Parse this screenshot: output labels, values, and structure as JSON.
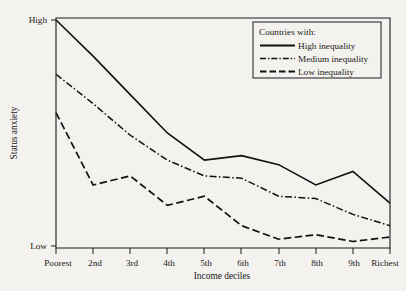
{
  "chart_data": {
    "type": "line",
    "title": "",
    "xlabel": "Income deciles",
    "ylabel": "Status anxiety",
    "categories": [
      "Poorest",
      "2nd",
      "3rd",
      "4th",
      "5th",
      "6th",
      "7th",
      "8th",
      "9th",
      "Richest"
    ],
    "ytick_labels": [
      "High",
      "Low"
    ],
    "ylim_labels": {
      "top": "High",
      "bottom": "Low"
    },
    "grid": false,
    "legend_position": "top-right",
    "legend_title": "Countries with:",
    "series": [
      {
        "name": "High inequality",
        "style": "solid",
        "values": [
          100,
          84,
          67,
          50,
          38,
          40,
          36,
          27,
          33,
          19
        ]
      },
      {
        "name": "Medium inequality",
        "style": "dash-dot",
        "values": [
          76,
          63,
          49,
          38,
          31,
          30,
          22,
          21,
          14,
          9
        ]
      },
      {
        "name": "Low inequality",
        "style": "dashed",
        "values": [
          59,
          27,
          31,
          18,
          22,
          9,
          3,
          5,
          2,
          4
        ]
      }
    ]
  },
  "legend": {
    "title": "Countries with:",
    "entries": [
      {
        "label": "High inequality",
        "style": "solid"
      },
      {
        "label": "Medium inequality",
        "style": "dash-dot"
      },
      {
        "label": "Low inequality",
        "style": "dashed"
      }
    ]
  },
  "axes": {
    "y_title": "Status anxiety",
    "x_title": "Income deciles",
    "y_high": "High",
    "y_low": "Low"
  }
}
